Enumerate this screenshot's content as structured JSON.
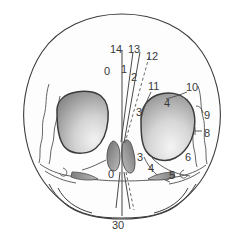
{
  "figure": {
    "name": "skull-frontal-view-numbered-diagram",
    "type": "anatomical-line-diagram",
    "view": "anterior (frontal) view of human skull",
    "background_color": "#ffffff",
    "outline_color": "#3c3c3c",
    "fill_light": "#f7f7f7",
    "orbit_fill_dark": "#8a8a8a",
    "orbit_fill_light": "#e8e8e8",
    "nasal_fill": "#8e8e8e",
    "label_color": "#3a3a3a"
  },
  "labels": [
    {
      "id": "label-14",
      "text": "14",
      "x": 110,
      "y": 44
    },
    {
      "id": "label-13",
      "text": "13",
      "x": 128,
      "y": 44
    },
    {
      "id": "label-12",
      "text": "12",
      "x": 146,
      "y": 51
    },
    {
      "id": "label-0-top",
      "text": "0",
      "x": 107,
      "y": 66
    },
    {
      "id": "label-1",
      "text": "1",
      "x": 121,
      "y": 64
    },
    {
      "id": "label-2",
      "text": "2",
      "x": 131,
      "y": 70
    },
    {
      "id": "label-11",
      "text": "11",
      "x": 150,
      "y": 83
    },
    {
      "id": "label-10",
      "text": "10",
      "x": 188,
      "y": 84
    },
    {
      "id": "label-4-upper",
      "text": "4",
      "x": 165,
      "y": 99
    },
    {
      "id": "label-3-upper",
      "text": "3",
      "x": 138,
      "y": 108
    },
    {
      "id": "label-9",
      "text": "9",
      "x": 205,
      "y": 113
    },
    {
      "id": "label-8",
      "text": "8",
      "x": 204,
      "y": 131
    },
    {
      "id": "label-3-lower",
      "text": "3",
      "x": 139,
      "y": 155
    },
    {
      "id": "label-6",
      "text": "6",
      "x": 186,
      "y": 155
    },
    {
      "id": "label-4-lower",
      "text": "4",
      "x": 149,
      "y": 165
    },
    {
      "id": "label-0-bottom",
      "text": "0",
      "x": 110,
      "y": 171
    },
    {
      "id": "label-5",
      "text": "5",
      "x": 170,
      "y": 172
    },
    {
      "id": "label-30",
      "text": "30",
      "x": 112,
      "y": 221
    }
  ],
  "label_groups": {
    "midline_vertical_axis": [
      "14",
      "0",
      "30"
    ],
    "angled_reference_lines": [
      "13",
      "12",
      "1",
      "2"
    ],
    "right_side_structures": [
      "11",
      "10",
      "9",
      "8",
      "6",
      "5",
      "4",
      "3"
    ],
    "nasal_aperture": [
      "0"
    ]
  },
  "leader_lines": {
    "style_solid_color": "#4a4a4a",
    "style_dashed_color": "#6a6a6a",
    "dash_pattern": "3 2"
  },
  "regions": [
    {
      "name": "cranial-vault-outline",
      "interactable": false
    },
    {
      "name": "left-orbit",
      "interactable": false
    },
    {
      "name": "right-orbit",
      "interactable": false
    },
    {
      "name": "nasal-aperture-left",
      "interactable": false
    },
    {
      "name": "nasal-aperture-right",
      "interactable": false
    },
    {
      "name": "maxilla-left-shading",
      "interactable": false
    },
    {
      "name": "maxilla-right-shading",
      "interactable": false
    },
    {
      "name": "mandible-outline",
      "interactable": false
    },
    {
      "name": "temporal-line-left",
      "interactable": false
    },
    {
      "name": "temporal-line-right",
      "interactable": false
    }
  ]
}
